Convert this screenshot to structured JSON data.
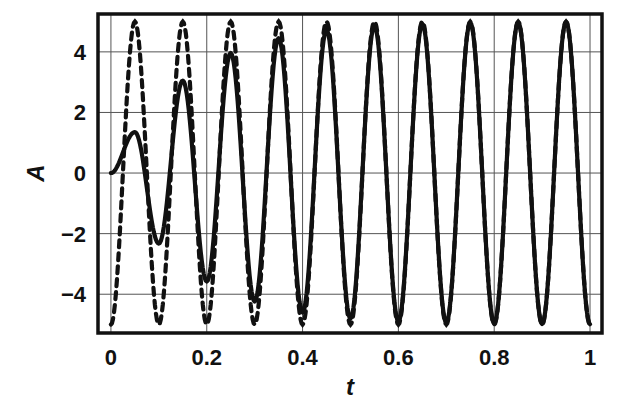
{
  "chart_data": {
    "type": "line",
    "title": "",
    "xlabel": "t",
    "ylabel": "A",
    "xlim": [
      -0.027,
      1.025
    ],
    "ylim": [
      -5.28,
      5.25
    ],
    "grid": true,
    "x_ticks": [
      0,
      0.2,
      0.4,
      0.6,
      0.8,
      1
    ],
    "x_tick_labels": [
      "0",
      "0.2",
      "0.4",
      "0.6",
      "0.8",
      "1"
    ],
    "y_ticks": [
      -4,
      -2,
      0,
      2,
      4
    ],
    "y_tick_labels": [
      "−4",
      "−2",
      "0",
      "2",
      "4"
    ],
    "legend": "none",
    "series": [
      {
        "name": "response",
        "style": "solid",
        "color": "#111111",
        "note": "extrema points; curve oscillates with period 0.1 between them",
        "x": [
          0,
          0.05,
          0.1,
          0.15,
          0.2,
          0.25,
          0.3,
          0.35,
          0.4,
          0.45,
          0.5,
          0.55,
          0.6,
          0.65,
          0.7,
          0.75,
          0.8,
          0.85,
          0.9,
          0.95,
          1.0
        ],
        "y": [
          0,
          1.35,
          -2.33,
          3.05,
          -3.58,
          3.96,
          -4.24,
          4.45,
          -4.6,
          4.72,
          -4.8,
          4.86,
          -4.9,
          4.92,
          -4.94,
          4.96,
          -4.97,
          4.98,
          -4.98,
          4.99,
          -4.99
        ]
      },
      {
        "name": "steady-state",
        "style": "dashed",
        "color": "#111111",
        "note": "extrema points; curve oscillates with period 0.1 between them",
        "x": [
          0,
          0.05,
          0.1,
          0.15,
          0.2,
          0.25,
          0.3,
          0.35,
          0.4,
          0.45,
          0.5,
          0.55,
          0.6,
          0.65,
          0.7,
          0.75,
          0.8,
          0.85,
          0.9,
          0.95,
          1.0
        ],
        "y": [
          -5,
          5,
          -5,
          5,
          -5,
          5,
          -5,
          5,
          -5,
          5,
          -5,
          5,
          -5,
          5,
          -5,
          5,
          -5,
          5,
          -5,
          5,
          -5
        ]
      }
    ]
  }
}
